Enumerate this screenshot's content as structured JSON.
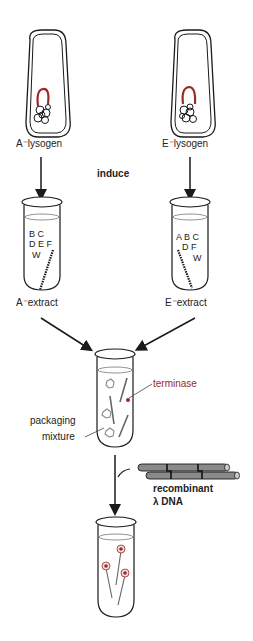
{
  "diagram": {
    "left": {
      "lysogen_label": "A⁻lysogen",
      "extract_label": "A⁻extract",
      "genes": [
        "B C",
        "D E F",
        "W"
      ]
    },
    "right": {
      "lysogen_label": "E⁻lysogen",
      "extract_label": "E⁻extract",
      "genes": [
        "A B C",
        "D F",
        "W"
      ]
    },
    "step_label": "induce",
    "mixture": {
      "label_line1": "packaging",
      "label_line2": "mixture",
      "terminase_label": "terminase"
    },
    "dna": {
      "label_line1": "recombinant",
      "label_line2": "λ DNA"
    },
    "colors": {
      "line": "#1a1a1a",
      "red": "#9a2a2a",
      "dna_gray": "#8a8a8a"
    }
  }
}
